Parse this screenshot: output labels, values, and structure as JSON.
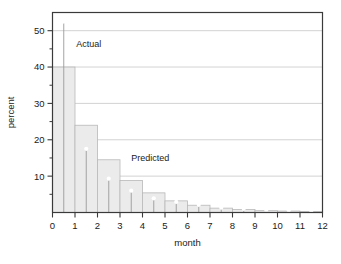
{
  "chart_data": {
    "type": "bar",
    "title": "",
    "subtitle": "",
    "xlabel": "month",
    "ylabel": "percent",
    "xlim": [
      0,
      12
    ],
    "ylim": [
      0,
      55
    ],
    "grid": "horizontal",
    "legend_position": "inline-annotations",
    "x_ticks": [
      "0",
      "1",
      "2",
      "3",
      "4",
      "5",
      "6",
      "7",
      "8",
      "9",
      "10",
      "11",
      "12"
    ],
    "x_tick_values": [
      0,
      1,
      2,
      3,
      4,
      5,
      6,
      7,
      8,
      9,
      10,
      11,
      12
    ],
    "y_ticks": [
      "10",
      "20",
      "30",
      "40",
      "50"
    ],
    "y_tick_values": [
      10,
      20,
      30,
      40,
      50
    ],
    "y_minor_tick_values": [
      5,
      15,
      25,
      35,
      45
    ],
    "bin_centers": [
      0.5,
      1.5,
      2.5,
      3.5,
      4.5,
      5.5,
      6.5,
      7.5,
      8.5,
      9.5,
      10.5,
      11.5
    ],
    "series": [
      {
        "name": "Actual",
        "render": "bar",
        "categories": [
          "0-1",
          "1-2",
          "2-3",
          "3-4",
          "4-5",
          "5-6",
          "6-7",
          "7-8",
          "8-9",
          "9-10",
          "10-11",
          "11-12"
        ],
        "values": [
          40.0,
          24.0,
          14.5,
          8.8,
          5.4,
          3.2,
          2.0,
          1.2,
          0.8,
          0.5,
          0.4,
          0.3
        ],
        "color": "#ebebeb",
        "edge_color": "#b8b8b8"
      },
      {
        "name": "Predicted",
        "render": "stem-with-circle-marker",
        "x": [
          0.5,
          1.5,
          2.5,
          3.5,
          4.5,
          5.5,
          6.5,
          7.5,
          8.5,
          9.5,
          10.5,
          11.5
        ],
        "values": [
          52.5,
          17.5,
          9.3,
          6.0,
          3.9,
          2.9,
          2.1,
          1.3,
          1.0,
          0.7,
          0.6,
          0.4
        ],
        "color": "#8c8c8c",
        "marker": "open-circle"
      }
    ],
    "annotations": [
      {
        "text": "Actual",
        "x": 1.05,
        "y": 45.5
      },
      {
        "text": "Predicted",
        "x": 3.5,
        "y": 14.2
      }
    ]
  },
  "colors": {
    "background": "#ffffff",
    "frame": "#3a3a3a",
    "gridline": "#c8c8c8",
    "bar_fill": "#ebebeb",
    "bar_edge": "#b8b8b8",
    "stem": "#9a9a9a",
    "marker_edge": "#8c8c8c",
    "text": "#1a1a1a"
  }
}
